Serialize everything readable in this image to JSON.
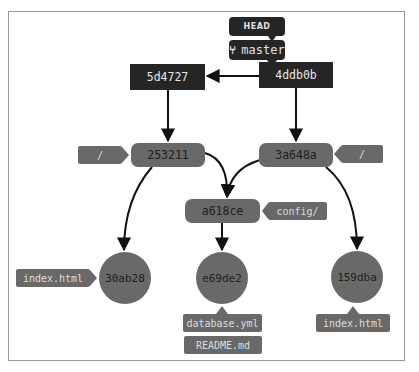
{
  "diagram": {
    "colors": {
      "commit": "#252525",
      "tree": "#696969",
      "blob": "#696969",
      "label": "#696969",
      "ref": "#252525",
      "edge": "#111111",
      "frame_border": "#9a9a9a"
    },
    "refs": {
      "head": "HEAD",
      "branch": "master",
      "branch_icon": "git-branch-icon"
    },
    "commits": [
      {
        "id": "4ddb0b",
        "parent": "5d4727",
        "tree": "3a648a"
      },
      {
        "id": "5d4727",
        "tree": "253211"
      }
    ],
    "trees": [
      {
        "id": "253211",
        "label": "/"
      },
      {
        "id": "3a648a",
        "label": "/"
      },
      {
        "id": "a618ce",
        "label": "config/"
      }
    ],
    "blobs": [
      {
        "id": "30ab28",
        "labels": [
          "index.html"
        ]
      },
      {
        "id": "e69de2",
        "labels": [
          "database.yml",
          "README.md"
        ]
      },
      {
        "id": "159dba",
        "labels": [
          "index.html"
        ]
      }
    ],
    "edges": [
      {
        "from": "HEAD",
        "to": "master"
      },
      {
        "from": "master",
        "to": "4ddb0b"
      },
      {
        "from": "4ddb0b",
        "to": "5d4727"
      },
      {
        "from": "5d4727",
        "to": "253211"
      },
      {
        "from": "4ddb0b",
        "to": "3a648a"
      },
      {
        "from": "253211",
        "to": "30ab28"
      },
      {
        "from": "253211",
        "to": "a618ce"
      },
      {
        "from": "3a648a",
        "to": "a618ce"
      },
      {
        "from": "3a648a",
        "to": "159dba"
      },
      {
        "from": "a618ce",
        "to": "e69de2"
      }
    ]
  }
}
